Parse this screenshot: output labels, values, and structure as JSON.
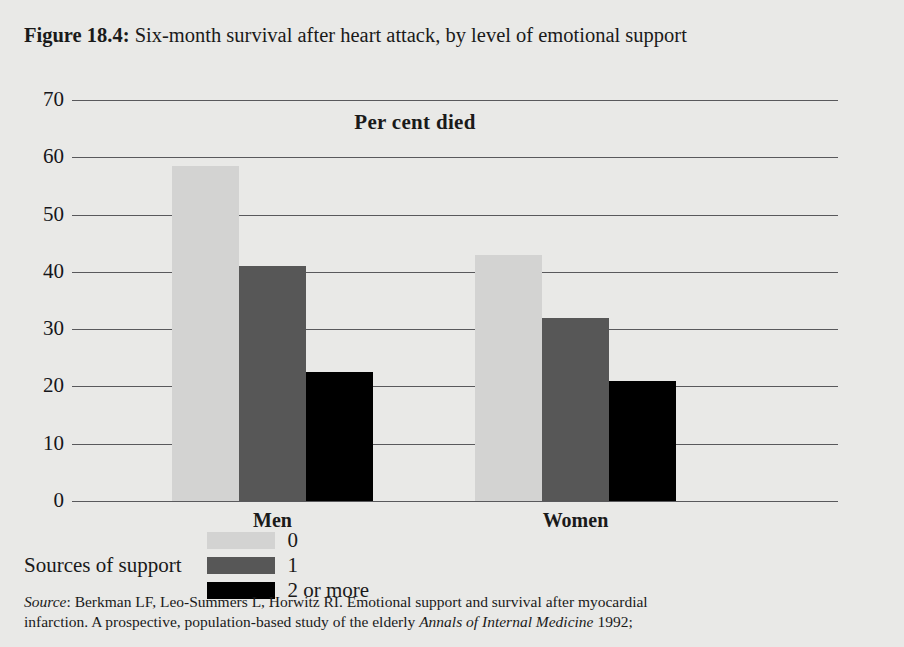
{
  "figure": {
    "number_label": "Figure 18.4:",
    "title_text": " Six-month survival after heart attack, by level of emotional support"
  },
  "chart_data": {
    "type": "bar",
    "title": "Six-month survival after heart attack, by level of emotional support",
    "axis_title": "Per cent died",
    "xlabel": "",
    "ylabel": "Per cent died",
    "categories": [
      "Men",
      "Women"
    ],
    "series": [
      {
        "name": "0",
        "values": [
          58.5,
          43.0
        ],
        "color": "#d3d3d2"
      },
      {
        "name": "1",
        "values": [
          41.0,
          32.0
        ],
        "color": "#575757"
      },
      {
        "name": "2 or more",
        "values": [
          22.5,
          21.0
        ],
        "color": "#000000"
      }
    ],
    "ylim": [
      0,
      70
    ],
    "yticks": [
      "70",
      "60",
      "50",
      "40",
      "30",
      "20",
      "10",
      "0"
    ],
    "ytick_values": [
      70,
      60,
      50,
      40,
      30,
      20,
      10,
      0
    ],
    "grid": true,
    "legend_position": "bottom-left",
    "legend_title": "Sources of support"
  },
  "legend": {
    "title": "Sources of support",
    "items": [
      {
        "label": "0",
        "color": "#d3d3d2"
      },
      {
        "label": "1",
        "color": "#575757"
      },
      {
        "label": "2 or more",
        "color": "#000000"
      }
    ]
  },
  "source_note": {
    "prefix": "Source",
    "line1_a": ": Berkman LF, Leo-Summers L, Horwitz RI. Emotional support and survival after myocardial",
    "line2_a": "infarction. A prospective, population-based study of the elderly ",
    "line2_italic": "Annals of Internal Medicine",
    "line2_b": " 1992;"
  }
}
